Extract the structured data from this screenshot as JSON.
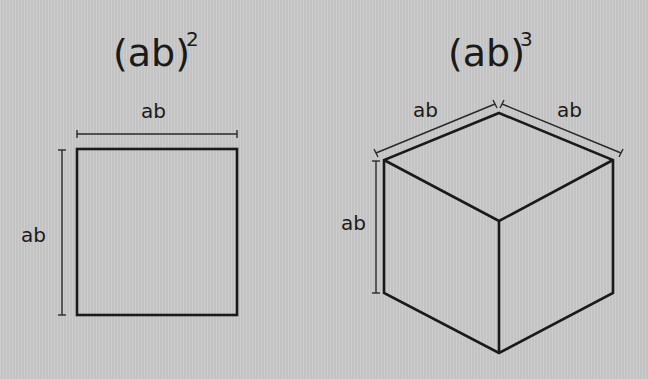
{
  "square": {
    "title_base": "(ab)",
    "title_exponent": "2",
    "top_label": "ab",
    "side_label": "ab"
  },
  "cube": {
    "title_base": "(ab)",
    "title_exponent": "3",
    "left_top_label": "ab",
    "right_top_label": "ab",
    "side_label": "ab"
  },
  "colors": {
    "background": "#c9c9c9",
    "line": "#1a1a1a"
  }
}
